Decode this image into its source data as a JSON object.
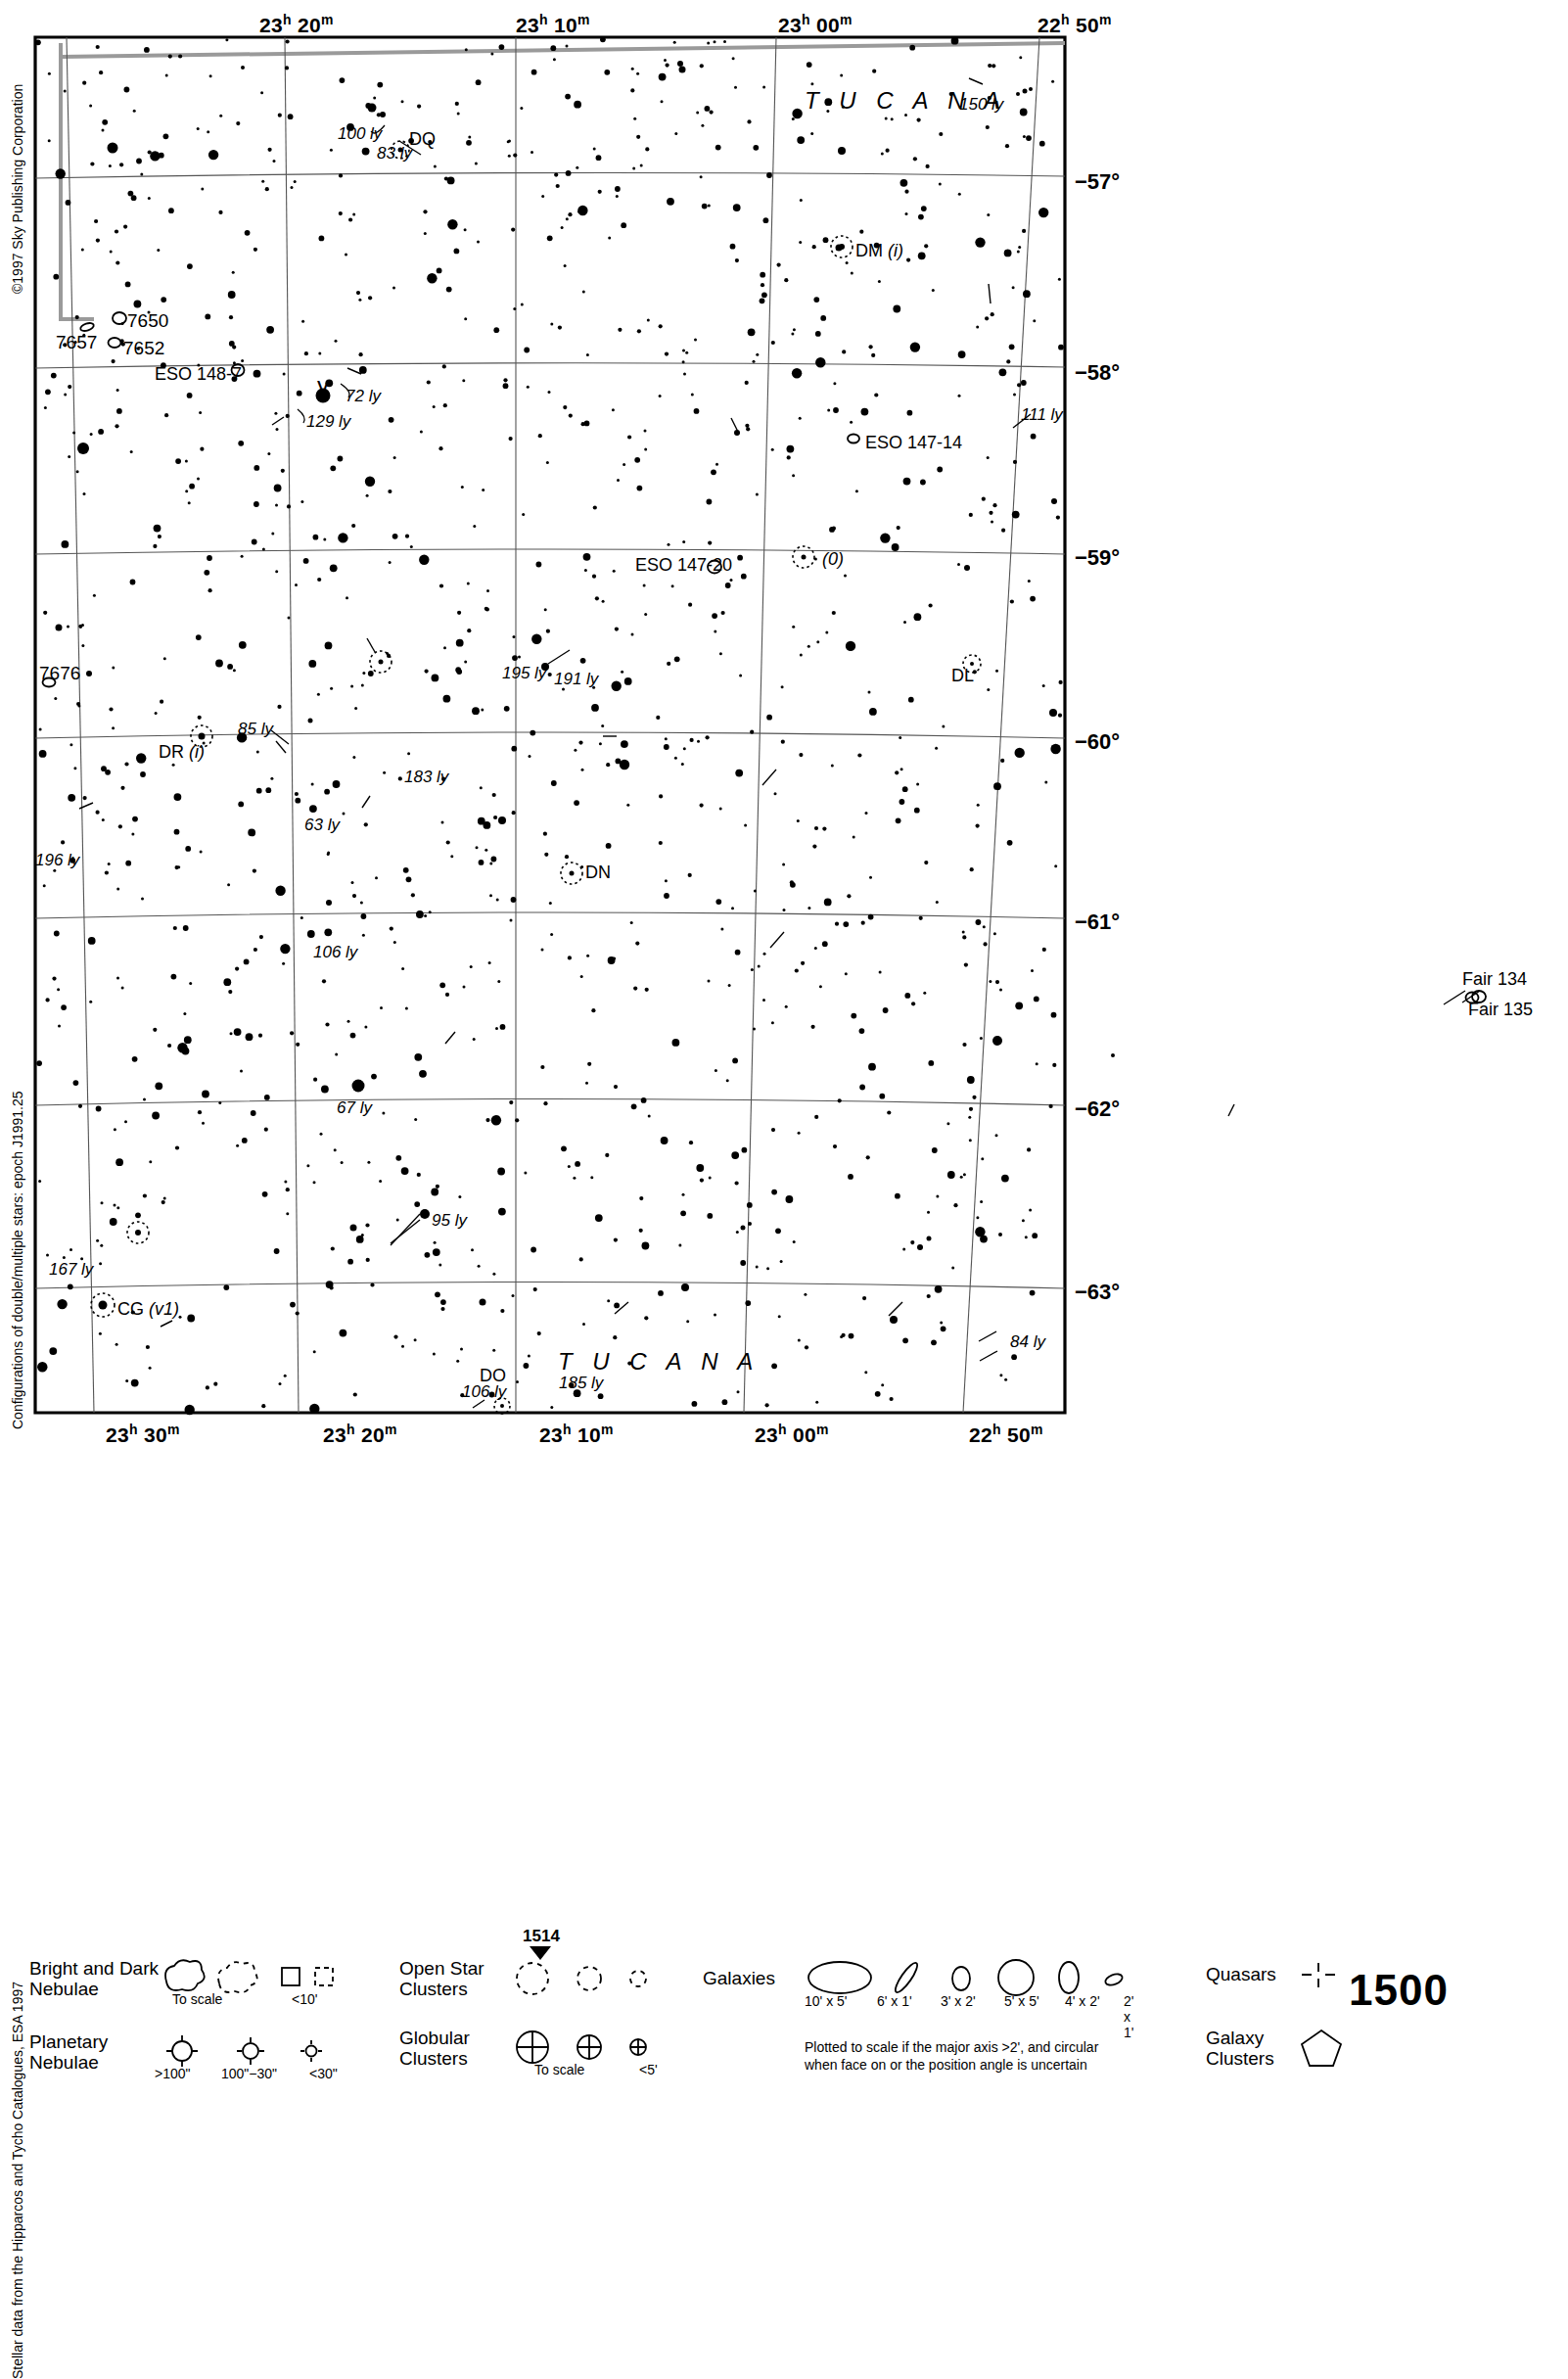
{
  "meta": {
    "copyright": "©1997 Sky Publishing Corporation",
    "note_double_stars": "Configurations of double/multiple stars: epoch J1991.25",
    "note_stellar_data": "Stellar data from the Hipparcos and Tycho Catalogues, ESA 1997",
    "chart_number": "1500",
    "continuation_number": "1514"
  },
  "chart_data": {
    "type": "scatter",
    "xlabel": "Right Ascension",
    "ylabel": "Declination",
    "xlim": [
      "23h 33m",
      "22h 47m"
    ],
    "ylim": [
      -63.6,
      -56.4
    ],
    "grid": true,
    "ra_ticks_top": [
      "23h 20m",
      "23h 10m",
      "23h 00m",
      "22h 50m"
    ],
    "ra_ticks_bottom": [
      "23h 30m",
      "23h 20m",
      "23h 10m",
      "23h 00m",
      "22h 50m"
    ],
    "dec_ticks": [
      "-57°",
      "-58°",
      "-59°",
      "-60°",
      "-61°",
      "-62°",
      "-63°"
    ],
    "constellations": [
      "TUCANA"
    ],
    "annotations": [
      "100 ly",
      "83 ly",
      "150 ly",
      "111 ly",
      "72 ly",
      "129 ly",
      "195 ly",
      "191 ly",
      "85 ly",
      "183 ly",
      "63 ly",
      "196 ly",
      "106 ly",
      "67 ly",
      "95 ly",
      "167 ly",
      "84 ly",
      "185 ly",
      "106 ly"
    ],
    "deep_sky": [
      "7650",
      "7652",
      "7657",
      "7676",
      "ESO 148-7",
      "ESO 147-14",
      "ESO 147-20",
      "Fair 134",
      "Fair 135"
    ],
    "variable_stars": [
      "DQ",
      "DM (i)",
      "DL",
      "DN",
      "DR (i)",
      "DO",
      "CG (v1)",
      "(0)"
    ],
    "bayer_letters": [
      "γ"
    ]
  },
  "ra_labels_top": [
    {
      "h": "23",
      "hs": "h",
      "m": "20",
      "ms": "m",
      "x": 265
    },
    {
      "h": "23",
      "hs": "h",
      "m": "10",
      "ms": "m",
      "x": 527
    },
    {
      "h": "23",
      "hs": "h",
      "m": "00",
      "ms": "m",
      "x": 795
    },
    {
      "h": "22",
      "hs": "h",
      "m": "50",
      "ms": "m",
      "x": 1060
    }
  ],
  "ra_labels_bottom": [
    {
      "h": "23",
      "hs": "h",
      "m": "30",
      "ms": "m",
      "x": 108
    },
    {
      "h": "23",
      "hs": "h",
      "m": "20",
      "ms": "m",
      "x": 330
    },
    {
      "h": "23",
      "hs": "h",
      "m": "10",
      "ms": "m",
      "x": 551
    },
    {
      "h": "23",
      "hs": "h",
      "m": "00",
      "ms": "m",
      "x": 771
    },
    {
      "h": "22",
      "hs": "h",
      "m": "50",
      "ms": "m",
      "x": 990
    }
  ],
  "dec_labels": [
    {
      "text": "−57°",
      "y": 187
    },
    {
      "text": "−58°",
      "y": 382
    },
    {
      "text": "−59°",
      "y": 571
    },
    {
      "text": "−60°",
      "y": 759
    },
    {
      "text": "−61°",
      "y": 943
    },
    {
      "text": "−62°",
      "y": 1134
    },
    {
      "text": "−63°",
      "y": 1321
    }
  ],
  "constellation_labels": [
    {
      "text": "T U C A N A",
      "x": 822,
      "y": 105
    },
    {
      "text": "T U C A N A",
      "x": 570,
      "y": 1393
    }
  ],
  "map_labels": [
    {
      "text": "100 ly",
      "x": 345,
      "y": 140,
      "style": "dist"
    },
    {
      "text": "DQ",
      "x": 418,
      "y": 145,
      "style": "obj"
    },
    {
      "text": "83 ly",
      "x": 385,
      "y": 160,
      "style": "dist"
    },
    {
      "text": "150 ly",
      "x": 980,
      "y": 110,
      "style": "dist"
    },
    {
      "text": "DM (i)",
      "x": 874,
      "y": 259,
      "style": "obj-i"
    },
    {
      "text": "7650",
      "x": 130,
      "y": 330,
      "style": "ngc"
    },
    {
      "text": "7657",
      "x": 57,
      "y": 352,
      "style": "ngc"
    },
    {
      "text": "7652",
      "x": 126,
      "y": 358,
      "style": "ngc"
    },
    {
      "text": "ESO 148-7",
      "x": 158,
      "y": 385,
      "style": "obj"
    },
    {
      "text": "γ",
      "x": 324,
      "y": 393,
      "style": "greek"
    },
    {
      "text": "72 ly",
      "x": 353,
      "y": 408,
      "style": "dist"
    },
    {
      "text": "129 ly",
      "x": 313,
      "y": 434,
      "style": "dist"
    },
    {
      "text": "111 ly",
      "x": 1043,
      "y": 427,
      "style": "dist"
    },
    {
      "text": "ESO 147-14",
      "x": 884,
      "y": 455,
      "style": "obj"
    },
    {
      "text": "ESO 147-20",
      "x": 649,
      "y": 580,
      "style": "obj"
    },
    {
      "text": "(0)",
      "x": 840,
      "y": 574,
      "style": "obj-i"
    },
    {
      "text": "7676",
      "x": 40,
      "y": 690,
      "style": "ngc"
    },
    {
      "text": "195 ly",
      "x": 513,
      "y": 691,
      "style": "dist"
    },
    {
      "text": "191 ly",
      "x": 566,
      "y": 697,
      "style": "dist"
    },
    {
      "text": "DL",
      "x": 972,
      "y": 693,
      "style": "obj"
    },
    {
      "text": "85 ly",
      "x": 243,
      "y": 748,
      "style": "dist"
    },
    {
      "text": "DR (i)",
      "x": 162,
      "y": 771,
      "style": "obj-i"
    },
    {
      "text": "183 ly",
      "x": 413,
      "y": 797,
      "style": "dist"
    },
    {
      "text": "63 ly",
      "x": 311,
      "y": 846,
      "style": "dist"
    },
    {
      "text": "DN",
      "x": 598,
      "y": 894,
      "style": "obj"
    },
    {
      "text": "196 ly",
      "x": 36,
      "y": 882,
      "style": "dist"
    },
    {
      "text": "106 ly",
      "x": 320,
      "y": 976,
      "style": "dist"
    },
    {
      "text": "Fair 134",
      "x": 1494,
      "y": 1003,
      "style": "obj"
    },
    {
      "text": "Fair 135",
      "x": 1500,
      "y": 1034,
      "style": "obj"
    },
    {
      "text": "67 ly",
      "x": 344,
      "y": 1135,
      "style": "dist"
    },
    {
      "text": "95 ly",
      "x": 441,
      "y": 1250,
      "style": "dist"
    },
    {
      "text": "167 ly",
      "x": 50,
      "y": 1300,
      "style": "dist"
    },
    {
      "text": "CG (v1)",
      "x": 120,
      "y": 1340,
      "style": "obj-i"
    },
    {
      "text": "84 ly",
      "x": 1032,
      "y": 1374,
      "style": "dist"
    },
    {
      "text": "DO",
      "x": 490,
      "y": 1408,
      "style": "obj"
    },
    {
      "text": "106 ly",
      "x": 472,
      "y": 1425,
      "style": "dist"
    },
    {
      "text": "185 ly",
      "x": 571,
      "y": 1416,
      "style": "dist"
    }
  ],
  "legend": {
    "nebulae": {
      "title_line1": "Bright and Dark",
      "title_line2": "Nebulae",
      "sub_to_scale": "To scale",
      "sub_small": "<10'"
    },
    "planetary": {
      "title_line1": "Planetary",
      "title_line2": "Nebulae",
      "sizes": [
        ">100\"",
        "100\"−30\"",
        "<30\""
      ]
    },
    "open_clusters": {
      "title_line1": "Open Star",
      "title_line2": "Clusters"
    },
    "globular_clusters": {
      "title_line1": "Globular",
      "title_line2": "Clusters",
      "sub_to_scale": "To scale",
      "sub_small": "<5'"
    },
    "galaxies": {
      "title": "Galaxies",
      "sizes": [
        "10' x 5'",
        "6' x 1'",
        "3' x 2'",
        "5' x 5'",
        "4' x 2'",
        "2' x 1'"
      ],
      "note_line1": "Plotted to scale if the major axis >2', and circular",
      "note_line2": "when face on or the position angle is uncertain"
    },
    "quasars": {
      "title": "Quasars"
    },
    "galaxy_clusters": {
      "title_line1": "Galaxy",
      "title_line2": "Clusters"
    }
  }
}
